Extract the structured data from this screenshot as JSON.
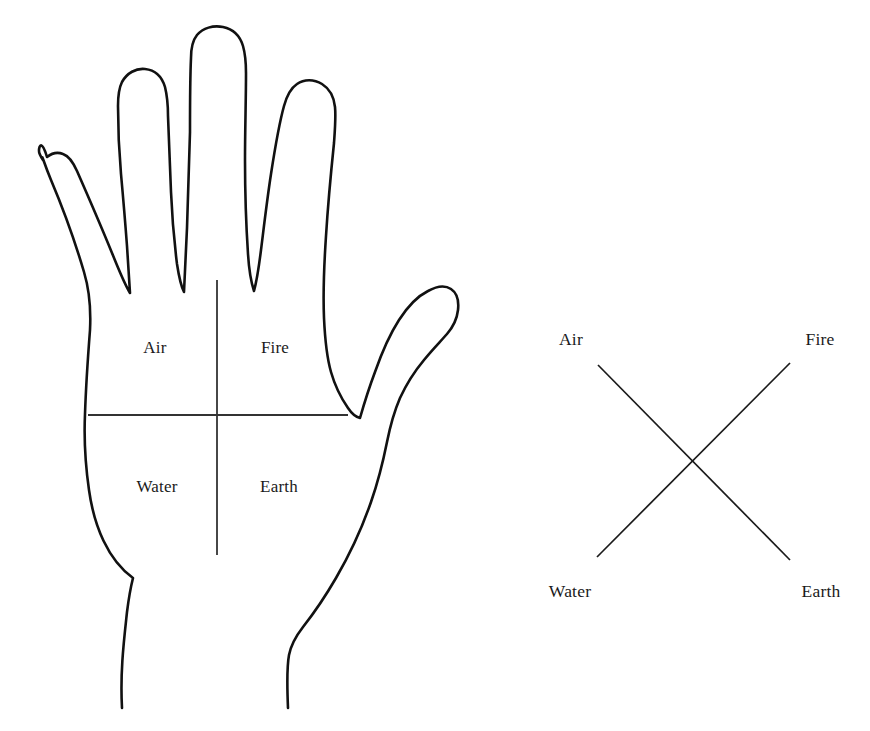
{
  "page": {
    "background_color": "#ffffff",
    "ink_color": "#111111",
    "width": 870,
    "height": 731
  },
  "hand_diagram": {
    "name": "hand-outline-diagram",
    "description": "Outline of an open left palm divided into four quadrants by a vertical and a horizontal line",
    "quadrant_labels": [
      {
        "id": "air",
        "text": "Air",
        "quadrant": "upper-left",
        "x": 155,
        "y": 348
      },
      {
        "id": "fire",
        "text": "Fire",
        "quadrant": "upper-right",
        "x": 275,
        "y": 348
      },
      {
        "id": "water",
        "text": "Water",
        "quadrant": "lower-left",
        "x": 157,
        "y": 487
      },
      {
        "id": "earth",
        "text": "Earth",
        "quadrant": "lower-right",
        "x": 279,
        "y": 487
      }
    ],
    "divider_lines": {
      "vertical": {
        "x": 217,
        "y1": 280,
        "y2": 555
      },
      "horizontal": {
        "y": 415,
        "x1": 88,
        "x2": 348
      }
    }
  },
  "cross_diagram": {
    "name": "elemental-cross-diagram",
    "description": "An X shape with the four elements labelled at its four corners",
    "corner_labels": [
      {
        "id": "air",
        "text": "Air",
        "corner": "top-left",
        "x": 571,
        "y": 340
      },
      {
        "id": "fire",
        "text": "Fire",
        "corner": "top-right",
        "x": 820,
        "y": 340
      },
      {
        "id": "water",
        "text": "Water",
        "corner": "bottom-left",
        "x": 570,
        "y": 592
      },
      {
        "id": "earth",
        "text": "Earth",
        "corner": "bottom-right",
        "x": 821,
        "y": 592
      }
    ],
    "strokes": [
      {
        "id": "air-to-earth",
        "x1": 598,
        "y1": 365,
        "x2": 790,
        "y2": 560
      },
      {
        "id": "fire-to-water",
        "x1": 790,
        "y1": 363,
        "x2": 597,
        "y2": 557
      }
    ],
    "intersection": {
      "x": 694,
      "y": 461
    }
  }
}
